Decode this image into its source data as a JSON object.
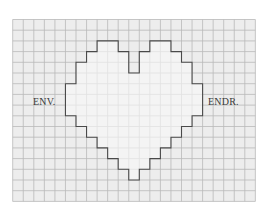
{
  "labels": {
    "left": "ENV.",
    "right": "ENDR."
  },
  "grid": {
    "x0": 12.7,
    "y0": 19.5,
    "cell_w": 10.55,
    "cell_h": 10.7,
    "cols": 23,
    "rows": 17,
    "background": "#ededed",
    "line_color": "#b9b9b9",
    "fade_right_color": "#f7f7f7"
  },
  "heart": {
    "fill": "#f8f8f8",
    "stroke": "#4a4a4a",
    "outline_cells": [
      [
        8,
        2
      ],
      [
        10,
        2
      ],
      [
        10,
        3
      ],
      [
        11,
        3
      ],
      [
        11,
        5
      ],
      [
        12,
        5
      ],
      [
        12,
        3
      ],
      [
        13,
        3
      ],
      [
        13,
        2
      ],
      [
        15,
        2
      ],
      [
        15,
        3
      ],
      [
        16,
        3
      ],
      [
        16,
        4
      ],
      [
        17,
        4
      ],
      [
        17,
        6
      ],
      [
        18,
        6
      ],
      [
        18,
        9
      ],
      [
        17,
        9
      ],
      [
        17,
        10
      ],
      [
        16,
        10
      ],
      [
        16,
        11
      ],
      [
        15,
        11
      ],
      [
        15,
        12
      ],
      [
        14,
        12
      ],
      [
        14,
        13
      ],
      [
        13,
        13
      ],
      [
        13,
        14
      ],
      [
        12,
        14
      ],
      [
        12,
        15
      ],
      [
        11,
        15
      ],
      [
        11,
        14
      ],
      [
        10,
        14
      ],
      [
        10,
        13
      ],
      [
        9,
        13
      ],
      [
        9,
        12
      ],
      [
        8,
        12
      ],
      [
        8,
        11
      ],
      [
        7,
        11
      ],
      [
        7,
        10
      ],
      [
        6,
        10
      ],
      [
        6,
        9
      ],
      [
        5,
        9
      ],
      [
        5,
        6
      ],
      [
        6,
        6
      ],
      [
        6,
        4
      ],
      [
        7,
        4
      ],
      [
        7,
        3
      ],
      [
        8,
        3
      ]
    ]
  }
}
